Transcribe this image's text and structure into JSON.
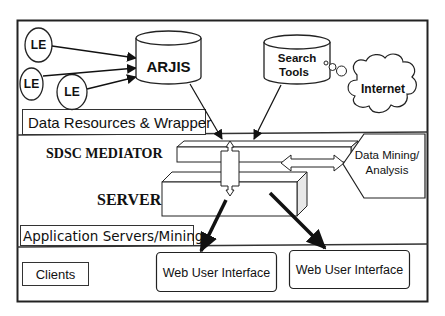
{
  "diagram": {
    "sections": {
      "data_resources": {
        "label": "Data Resources & Wrapper"
      },
      "application": {
        "label": "Application Servers/Mining"
      },
      "clients": {
        "label": "Clients"
      }
    },
    "nodes": {
      "le1": {
        "label": "LE"
      },
      "le2": {
        "label": "LE"
      },
      "le3": {
        "label": "LE"
      },
      "arjis": {
        "label": "ARJIS"
      },
      "search_tools": {
        "label_line1": "Search",
        "label_line2": "Tools"
      },
      "internet": {
        "label": "Internet"
      },
      "mediator": {
        "label": "SDSC MEDIATOR"
      },
      "server": {
        "label": "SERVER"
      },
      "data_mining": {
        "label_line1": "Data Mining/",
        "label_line2": "Analysis"
      },
      "web_ui_1": {
        "label": "Web User Interface"
      },
      "web_ui_2": {
        "label": "Web User Interface"
      }
    },
    "edges": [
      {
        "from": "le1",
        "to": "arjis"
      },
      {
        "from": "le2",
        "to": "arjis"
      },
      {
        "from": "le3",
        "to": "arjis"
      },
      {
        "from": "arjis",
        "to": "mediator"
      },
      {
        "from": "search_tools",
        "to": "mediator"
      },
      {
        "from": "search_tools",
        "to": "internet",
        "style": "thought-bubble"
      },
      {
        "from": "mediator",
        "to": "server",
        "style": "bidirectional-block"
      },
      {
        "from": "mediator",
        "to": "data_mining",
        "style": "bidirectional-block"
      },
      {
        "from": "server",
        "to": "web_ui_1",
        "style": "bold"
      },
      {
        "from": "server",
        "to": "web_ui_2",
        "style": "bold"
      }
    ]
  }
}
